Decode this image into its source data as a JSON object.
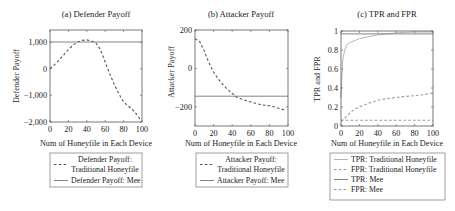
{
  "chart_data": [
    {
      "id": "a",
      "type": "line",
      "title": "(a) Defender Payoff",
      "xlabel": "Num of Honeyfile in Each Device",
      "ylabel": "Defender Payoff",
      "xlim": [
        0,
        100
      ],
      "ylim": [
        -2000,
        1450
      ],
      "xticks": [
        0,
        20,
        40,
        60,
        80,
        100
      ],
      "xtick_labels": [
        "0",
        "20",
        "40",
        "60",
        "80",
        "100"
      ],
      "yticks": [
        1000,
        0,
        -1000,
        -2000
      ],
      "ytick_labels": [
        "1,000",
        "0",
        "−1,000",
        "−2,000"
      ],
      "grid": false,
      "legend_position": "below",
      "series": [
        {
          "name": "Defender Payoff: Traditional Honeyfile",
          "legend_lines": [
            "Defender Payoff:",
            "Traditional Honeyfile"
          ],
          "style": "dashed",
          "color": "#555555",
          "x": [
            0,
            5,
            10,
            15,
            20,
            25,
            30,
            35,
            40,
            45,
            50,
            55,
            60,
            65,
            70,
            75,
            80,
            85,
            90,
            95,
            98
          ],
          "y": [
            0,
            150,
            330,
            520,
            720,
            880,
            1000,
            1060,
            1080,
            1040,
            960,
            700,
            250,
            -200,
            -600,
            -950,
            -1250,
            -1400,
            -1550,
            -1750,
            -1900
          ]
        },
        {
          "name": "Defender Payoff: Mee",
          "legend_lines": [
            "Defender Payoff: Mee"
          ],
          "style": "solid",
          "color": "#777777",
          "x": [
            0,
            100
          ],
          "y": [
            1000,
            1000
          ]
        }
      ]
    },
    {
      "id": "b",
      "type": "line",
      "title": "(b) Attacker Payoff",
      "xlabel": "Num of Honeyfile in Each Device",
      "ylabel": "Attacker Payoff",
      "xlim": [
        0,
        100
      ],
      "ylim": [
        -300,
        200
      ],
      "xticks": [
        0,
        20,
        40,
        60,
        80,
        100
      ],
      "xtick_labels": [
        "0",
        "20",
        "40",
        "60",
        "80",
        "100"
      ],
      "yticks": [
        200,
        0,
        -200
      ],
      "ytick_labels": [
        "200",
        "0",
        "−200"
      ],
      "grid": false,
      "legend_position": "below",
      "series": [
        {
          "name": "Attacker Payoff: Traditional Honeyfile",
          "legend_lines": [
            "Attacker Payoff:",
            "Traditional Honeyfile"
          ],
          "style": "dashed",
          "color": "#555555",
          "x": [
            0,
            5,
            10,
            15,
            20,
            25,
            30,
            35,
            40,
            45,
            50,
            55,
            60,
            65,
            70,
            75,
            80,
            85,
            90,
            95,
            98
          ],
          "y": [
            155,
            140,
            90,
            30,
            -20,
            -55,
            -85,
            -110,
            -130,
            -150,
            -160,
            -168,
            -175,
            -182,
            -188,
            -192,
            -195,
            -200,
            -208,
            -215,
            -220
          ]
        },
        {
          "name": "Attacker Payoff: Mee",
          "legend_lines": [
            "Attacker Payoff: Mee"
          ],
          "style": "solid",
          "color": "#777777",
          "x": [
            0,
            100
          ],
          "y": [
            -145,
            -145
          ]
        }
      ]
    },
    {
      "id": "c",
      "type": "line",
      "title": "(c) TPR and FPR",
      "xlabel": "Num of Honeyfile in Each Device",
      "ylabel": "TPR and FPR",
      "xlim": [
        0,
        100
      ],
      "ylim": [
        0,
        1
      ],
      "xticks": [
        0,
        20,
        40,
        60,
        80,
        100
      ],
      "xtick_labels": [
        "0",
        "20",
        "40",
        "60",
        "80",
        "100"
      ],
      "yticks": [
        1,
        0.8,
        0.6,
        0.4,
        0.2,
        0
      ],
      "ytick_labels": [
        "1",
        "0.8",
        "0.6",
        "0.4",
        "0.2",
        "0"
      ],
      "grid": false,
      "legend_position": "below",
      "series": [
        {
          "name": "TPR: Traditional Honeyfile",
          "legend_lines": [
            "TPR: Traditional Honeyfile"
          ],
          "style": "solid",
          "color": "#aaaaaa",
          "x": [
            0,
            1,
            2,
            4,
            6,
            10,
            15,
            20,
            30,
            40,
            50,
            60,
            70,
            80,
            90,
            100
          ],
          "y": [
            0.3,
            0.5,
            0.7,
            0.8,
            0.85,
            0.88,
            0.9,
            0.92,
            0.94,
            0.96,
            0.97,
            0.98,
            0.985,
            0.99,
            0.99,
            0.99
          ]
        },
        {
          "name": "FPR: Traditional Honeyfile",
          "legend_lines": [
            "FPR: Traditional Honeyfile"
          ],
          "style": "dashed",
          "color": "#999999",
          "x": [
            0,
            5,
            10,
            15,
            20,
            30,
            40,
            50,
            60,
            70,
            80,
            90,
            100
          ],
          "y": [
            0.05,
            0.09,
            0.14,
            0.18,
            0.2,
            0.24,
            0.27,
            0.29,
            0.3,
            0.31,
            0.32,
            0.33,
            0.35
          ]
        },
        {
          "name": "TPR: Mee",
          "legend_lines": [
            "TPR: Mee"
          ],
          "style": "solid",
          "color": "#777777",
          "x": [
            0,
            100
          ],
          "y": [
            0.97,
            0.97
          ]
        },
        {
          "name": "FPR: Mee",
          "legend_lines": [
            "FPR: Mee"
          ],
          "style": "dashed",
          "color": "#999999",
          "x": [
            0,
            100
          ],
          "y": [
            0.06,
            0.06
          ]
        }
      ]
    }
  ],
  "panels": {
    "a": {
      "title": "(a) Defender Payoff",
      "xlabel": "Num of Honeyfile in Each Device",
      "ylabel": "Defender Payoff"
    },
    "b": {
      "title": "(b) Attacker Payoff",
      "xlabel": "Num of Honeyfile in Each Device",
      "ylabel": "Attacker Payoff"
    },
    "c": {
      "title": "(c) TPR and FPR",
      "xlabel": "Num of Honeyfile in Each Device",
      "ylabel": "TPR and FPR"
    }
  }
}
